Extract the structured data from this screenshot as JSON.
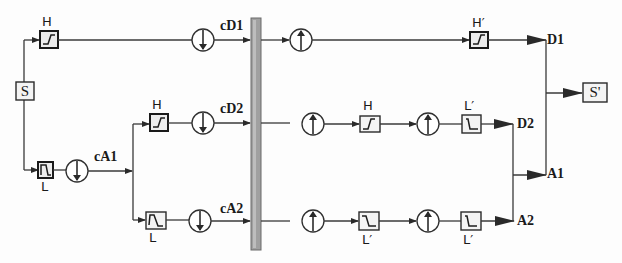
{
  "diagram": {
    "title": "",
    "colors": {
      "line": "#3a3a3a",
      "bar": "#9a9a9a",
      "box_fill": "#f4f4f4"
    },
    "input": {
      "label": "S"
    },
    "output": {
      "label": "S'"
    },
    "filters": {
      "row1_decomp": "H",
      "row1_recon": "H′",
      "level1_low": "L",
      "row2_decomp": "H",
      "row2_recon_h": "H",
      "row2_recon_l": "L′",
      "row3_decomp": "L",
      "row3_recon_l1": "L′",
      "row3_recon_l2": "L′"
    },
    "signals": {
      "cD1": "cD1",
      "cD2": "cD2",
      "cA1": "cA1",
      "cA2": "cA2",
      "D1": "D1",
      "D2": "D2",
      "A1": "A1",
      "A2": "A2"
    },
    "node_types": {
      "downsample": "downsample-by-2",
      "upsample": "upsample-by-2",
      "highpass": "high-pass-filter",
      "lowpass": "low-pass-filter"
    }
  }
}
